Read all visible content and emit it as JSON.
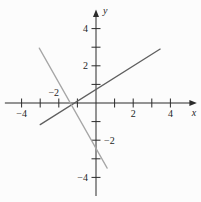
{
  "figure": {
    "background": "#fcfcfc",
    "axis_color": "#2b2b2b",
    "text_color": "#1c1c1c"
  },
  "chart_data": {
    "type": "line",
    "title": "",
    "xlabel": "x",
    "ylabel": "y",
    "xlim": [
      -4.9,
      5.1
    ],
    "ylim": [
      -5.0,
      4.7
    ],
    "grid": false,
    "legend": "none",
    "x_axis": {
      "label": "x",
      "ticks": [
        -4,
        -3,
        -2,
        -1,
        1,
        2,
        3,
        4
      ],
      "tick_labels": [
        {
          "value": -4,
          "text": "−4",
          "position": "below"
        },
        {
          "value": -2,
          "text": "−2",
          "position": "above"
        },
        {
          "value": 2,
          "text": "2",
          "position": "below"
        },
        {
          "value": 4,
          "text": "4",
          "position": "below"
        }
      ]
    },
    "y_axis": {
      "label": "y",
      "ticks": [
        -4,
        -3,
        -2,
        -1,
        1,
        2,
        3,
        4
      ],
      "tick_labels": [
        {
          "value": 4,
          "text": "4",
          "side": "left"
        },
        {
          "value": 2,
          "text": "2",
          "side": "left"
        },
        {
          "value": -2,
          "text": "−2",
          "side": "right"
        },
        {
          "value": -4,
          "text": "−4",
          "side": "left"
        }
      ]
    },
    "series": [
      {
        "name": "line-1",
        "description": "dark gray line, positive slope",
        "color": "#5f5f5f",
        "slope": 0.63,
        "y_intercept": 0.73,
        "x_intercept": -1.16,
        "segment_x": [
          -3.0,
          3.45
        ],
        "segment_y": [
          -1.16,
          2.9
        ]
      },
      {
        "name": "line-2",
        "description": "light gray line, negative slope",
        "color": "#a6a6a6",
        "slope": -1.77,
        "y_intercept": -2.47,
        "x_intercept": -1.4,
        "segment_x": [
          -3.05,
          0.6
        ],
        "segment_y": [
          2.95,
          -3.5
        ]
      }
    ]
  }
}
